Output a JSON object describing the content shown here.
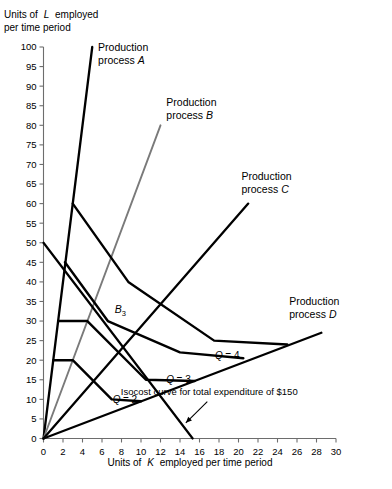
{
  "chart_data": {
    "type": "line",
    "title": "",
    "xlabel": "Units of K employed per time period",
    "ylabel": "Units of L employed per time period",
    "xlim": [
      0,
      30
    ],
    "ylim": [
      0,
      100
    ],
    "xticks": [
      0,
      2,
      4,
      6,
      8,
      10,
      12,
      14,
      16,
      18,
      20,
      22,
      24,
      26,
      28,
      30
    ],
    "yticks": [
      0,
      5,
      10,
      15,
      20,
      25,
      30,
      35,
      40,
      45,
      50,
      55,
      60,
      65,
      70,
      75,
      80,
      85,
      90,
      95,
      100
    ],
    "grid": false,
    "legend": "none",
    "series": [
      {
        "name": "Production process A",
        "kind": "ray",
        "color": "#000000",
        "label": "Production process A",
        "label_line1": "Production",
        "label_line2": "process",
        "label_letter": "A",
        "label_x": 5.6,
        "label_y": 99,
        "points": [
          [
            0,
            0
          ],
          [
            5.0,
            100.0
          ]
        ]
      },
      {
        "name": "Production process B",
        "kind": "ray",
        "color": "#7a7a7a",
        "label": "Production process B",
        "label_line1": "Production",
        "label_line2": "process",
        "label_letter": "B",
        "label_x": 12.6,
        "label_y": 85,
        "points": [
          [
            0,
            0
          ],
          [
            12.0,
            80.0
          ]
        ]
      },
      {
        "name": "Production process C",
        "kind": "ray",
        "color": "#000000",
        "label": "Production process C",
        "label_line1": "Production",
        "label_line2": "process",
        "label_letter": "C",
        "label_x": 20.3,
        "label_y": 66,
        "points": [
          [
            0,
            0
          ],
          [
            21.0,
            60.0
          ]
        ]
      },
      {
        "name": "Production process D",
        "kind": "ray",
        "color": "#000000",
        "label": "Production process D",
        "label_line1": "Production",
        "label_line2": "process",
        "label_letter": "D",
        "label_x": 25.2,
        "label_y": 34,
        "points": [
          [
            0,
            0
          ],
          [
            28.5,
            27.0
          ]
        ]
      },
      {
        "name": "Isoquant Q = 1",
        "kind": "isoquant",
        "color": "#000000",
        "label": "Q = 1",
        "points": [
          [
            1.0,
            20.0
          ],
          [
            3.0,
            20.0
          ],
          [
            7.0,
            10.0
          ],
          [
            10.0,
            9.5
          ]
        ]
      },
      {
        "name": "Isoquant Q = 2",
        "kind": "isoquant",
        "color": "#000000",
        "label": "Q = 2",
        "label_x": 9.6,
        "label_y": 9.0,
        "points": [
          [
            1.5,
            30.0
          ],
          [
            4.5,
            30.0
          ],
          [
            10.5,
            15.0
          ],
          [
            15.5,
            14.7
          ]
        ]
      },
      {
        "name": "Isoquant Q = 3",
        "kind": "isoquant",
        "color": "#000000",
        "label": "Q = 3",
        "label_x": 15.1,
        "label_y": 14.3,
        "points": [
          [
            2.2,
            45.0
          ],
          [
            6.6,
            30.0
          ],
          [
            14.0,
            22.0
          ],
          [
            20.5,
            20.5
          ]
        ]
      },
      {
        "name": "Isoquant Q = 4",
        "kind": "isoquant",
        "color": "#000000",
        "label": "Q = 4",
        "label_x": 20.1,
        "label_y": 20.2,
        "points": [
          [
            3.0,
            60.0
          ],
          [
            8.7,
            40.0
          ],
          [
            17.5,
            25.0
          ],
          [
            25.0,
            24.0
          ]
        ]
      },
      {
        "name": "Isocost curve",
        "kind": "isocost",
        "color": "#000000",
        "label": "Isocost curve for total expenditure of $150",
        "points": [
          [
            0.0,
            50.0
          ],
          [
            15.3,
            0.0
          ]
        ]
      }
    ],
    "annotations": [
      {
        "name": "point-B3",
        "text": "B",
        "subscript": "3",
        "x": 6.6,
        "y": 30.0,
        "label_x": 7.3,
        "label_y": 32.0
      },
      {
        "name": "isocost-note",
        "text": "Isocost curve for total expenditure of $150",
        "x": 17.0,
        "y": 11.0,
        "leader_from": [
          16.8,
          9.4
        ],
        "leader_to": [
          14.6,
          4.0
        ]
      }
    ]
  },
  "axis": {
    "y_title_line1": "Units of",
    "y_title_italic": "L",
    "y_title_line1_rest": "employed",
    "y_title_line2": "per time period",
    "x_title_pre": "Units of",
    "x_title_italic": "K",
    "x_title_post": "employed per time period"
  }
}
